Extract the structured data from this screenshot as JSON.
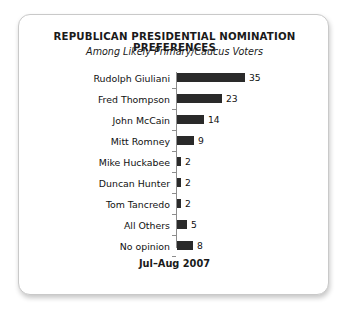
{
  "card": {
    "title": "REPUBLICAN PRESIDENTIAL NOMINATION PREFERENCES",
    "subtitle": "Among Likely Primary/Caucus Voters",
    "footer": "Jul–Aug 2007",
    "border_color": "#c9c9c9",
    "background_color": "#ffffff"
  },
  "chart_data": {
    "type": "bar",
    "orientation": "horizontal",
    "title": "REPUBLICAN PRESIDENTIAL NOMINATION PREFERENCES",
    "subtitle": "Among Likely Primary/Caucus Voters",
    "xlabel": "",
    "ylabel": "",
    "xlim": [
      0,
      35
    ],
    "grid": false,
    "legend": false,
    "bar_color": "#2a2a2a",
    "axis_color": "#8d8d8d",
    "categories": [
      "Rudolph Giuliani",
      "Fred Thompson",
      "John McCain",
      "Mitt Romney",
      "Mike Huckabee",
      "Duncan Hunter",
      "Tom Tancredo",
      "All Others",
      "No opinion"
    ],
    "values": [
      35,
      23,
      14,
      9,
      2,
      2,
      2,
      5,
      8
    ],
    "value_labels": [
      "35",
      "23",
      "14",
      "9",
      "2",
      "2",
      "2",
      "5",
      "8"
    ],
    "annotations": [
      "Jul–Aug 2007"
    ]
  }
}
